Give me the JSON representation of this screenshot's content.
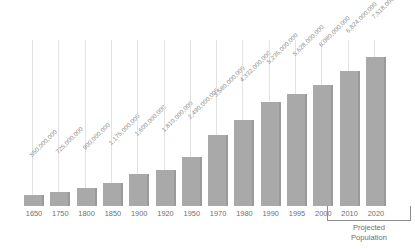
{
  "chart_data": {
    "type": "bar",
    "title": "",
    "subtitle": "",
    "xlabel": "",
    "ylabel": "",
    "grid": false,
    "legend": null,
    "ylim": [
      0,
      7518000000
    ],
    "categories": [
      "1650",
      "1750",
      "1800",
      "1850",
      "1900",
      "1920",
      "1950",
      "1970",
      "1980",
      "1990",
      "1995",
      "2000",
      "2010",
      "2020"
    ],
    "values": [
      550000000,
      725000000,
      900000000,
      1175000000,
      1600000000,
      1810000000,
      2490000000,
      3580000000,
      4332000000,
      5236000000,
      5628000000,
      6080000000,
      6824000000,
      7518000000
    ],
    "value_labels": [
      "550,000,000",
      "725,000,000",
      "900,000,000",
      "1,175,000,000",
      "1,600,000,000",
      "1,810,000,000",
      "2,490,000,000",
      "3,580,000,000",
      "4,332,000,000",
      "5,236,000,000",
      "5,628,000,000",
      "6,080,000,000",
      "6,824,000,000",
      "7,518,000,000"
    ],
    "annotations": [
      {
        "text": "Projected Population",
        "line1": "Projected",
        "line2": "Population",
        "covers_categories": [
          "2010",
          "2020"
        ]
      }
    ],
    "colors": {
      "bar": "#a9a9a9",
      "bar_edge": "#9a9a9a",
      "leader_line": "#e2e2e2",
      "value_label_text": "#8d8d8d",
      "category_label_text": "#6f6f6f",
      "annotation_text": "#6f6f6f",
      "background": "#ffffff"
    }
  }
}
